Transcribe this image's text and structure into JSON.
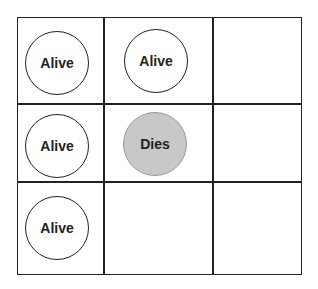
{
  "grid": {
    "rows": 3,
    "cols": 3,
    "cells": [
      {
        "row": 0,
        "col": 0,
        "label": "Alive",
        "state": "alive"
      },
      {
        "row": 0,
        "col": 1,
        "label": "Alive",
        "state": "alive"
      },
      {
        "row": 0,
        "col": 2,
        "label": "",
        "state": "empty"
      },
      {
        "row": 1,
        "col": 0,
        "label": "Alive",
        "state": "alive"
      },
      {
        "row": 1,
        "col": 1,
        "label": "Dies",
        "state": "dies"
      },
      {
        "row": 1,
        "col": 2,
        "label": "",
        "state": "empty"
      },
      {
        "row": 2,
        "col": 0,
        "label": "Alive",
        "state": "alive"
      },
      {
        "row": 2,
        "col": 1,
        "label": "",
        "state": "empty"
      },
      {
        "row": 2,
        "col": 2,
        "label": "",
        "state": "empty"
      }
    ]
  },
  "colors": {
    "alive_fill": "#ffffff",
    "dies_fill": "#c8c8c8",
    "line": "#222222"
  }
}
